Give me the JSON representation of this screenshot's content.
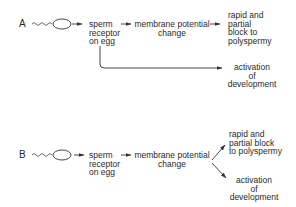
{
  "diagram": {
    "panel_a": {
      "letter": "A",
      "nodes": {
        "receptor": [
          "sperm",
          "receptor",
          "on egg"
        ],
        "membrane": [
          "membrane potential",
          "change"
        ],
        "block": [
          "rapid and",
          "partial",
          "block to",
          "polyspermy"
        ],
        "activation": [
          "activation",
          "of",
          "development"
        ]
      }
    },
    "panel_b": {
      "letter": "B",
      "nodes": {
        "receptor": [
          "sperm",
          "receptor",
          "on egg"
        ],
        "membrane": [
          "membrane potential",
          "change"
        ],
        "block": [
          "rapid and",
          "partial block",
          "to polyspermy"
        ],
        "activation": [
          "activation",
          "of",
          "development"
        ]
      }
    },
    "colors": {
      "line": "#333333",
      "text": "#2a2a2a"
    }
  }
}
